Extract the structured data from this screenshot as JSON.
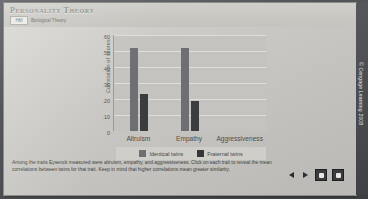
{
  "header": {
    "title": "Personality Theory",
    "tab_badge": "HM",
    "tab_label": "Biological Theory"
  },
  "caption": "Among the traits Eysenck measured were altruism, empathy, and aggressiveness. Click on each trait to reveal the mean correlations between twins for that trait. Keep in mind that higher correlations mean greater similarity.",
  "controls": {
    "back_icon": "previous-triangle-icon",
    "play_icon": "play-triangle-icon",
    "stop_icon": "stop-square-icon",
    "forward_icon": "forward-square-icon"
  },
  "copyright": "© Cengage Learning 2008",
  "colors": {
    "identical": "#6d6f72",
    "fraternal": "#35363a",
    "plot_bg": "#c4c3bf",
    "frame_bg": "#cfcec9"
  },
  "chart_data": {
    "type": "bar",
    "title": "",
    "xlabel": "",
    "ylabel": "Correlation of scores",
    "categories": [
      "Altruism",
      "Empathy",
      "Aggressiveness"
    ],
    "ylim": [
      0,
      0.6
    ],
    "yticks": [
      ".60",
      ".50",
      ".40",
      ".30",
      ".20",
      ".10",
      "0"
    ],
    "ytick_values": [
      0.6,
      0.5,
      0.4,
      0.3,
      0.2,
      0.1,
      0
    ],
    "grid": true,
    "legend_position": "bottom",
    "series": [
      {
        "name": "Identical twins",
        "color": "#6d6f72",
        "values": [
          0.52,
          0.52,
          null
        ]
      },
      {
        "name": "Fraternal twins",
        "color": "#35363a",
        "values": [
          0.23,
          0.19,
          null
        ]
      }
    ]
  }
}
